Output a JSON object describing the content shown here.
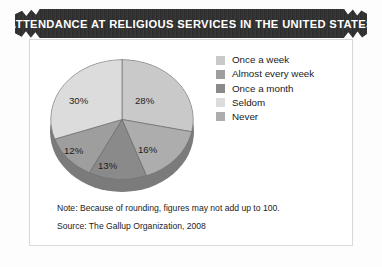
{
  "banner": {
    "title": "ATTENDANCE AT RELIGIOUS SERVICES IN THE UNITED STATES"
  },
  "footnotes": {
    "note": "Note: Because of rounding, figures may not add up to 100.",
    "source": "Source: The Gallup Organization, 2008"
  },
  "legend": {
    "items": [
      {
        "label": "Once a week",
        "color": "#c9c9c9"
      },
      {
        "label": "Almost every week",
        "color": "#9e9e9e"
      },
      {
        "label": "Once a month",
        "color": "#8a8a8a"
      },
      {
        "label": "Seldom",
        "color": "#dcdcdc"
      },
      {
        "label": "Never",
        "color": "#adadad"
      }
    ]
  },
  "labels": {
    "s0": "28%",
    "s1": "16%",
    "s2": "13%",
    "s3": "12%",
    "s4": "30%"
  },
  "chart_data": {
    "type": "pie",
    "title": "ATTENDANCE AT RELIGIOUS SERVICES IN THE UNITED STATES",
    "categories": [
      "Once a week",
      "Never",
      "Once a month",
      "Almost every week",
      "Seldom"
    ],
    "values": [
      28,
      16,
      13,
      12,
      30
    ],
    "value_labels": [
      "28%",
      "16%",
      "13%",
      "12%",
      "30%"
    ],
    "colors": [
      "#c9c9c9",
      "#adadad",
      "#8a8a8a",
      "#9e9e9e",
      "#dcdcdc"
    ],
    "units": "percent",
    "legend_position": "right",
    "legend_order": [
      "Once a week",
      "Almost every week",
      "Once a month",
      "Seldom",
      "Never"
    ],
    "grid": false,
    "note": "Note: Because of rounding, figures may not add up to 100.",
    "source": "Source: The Gallup Organization, 2008"
  }
}
